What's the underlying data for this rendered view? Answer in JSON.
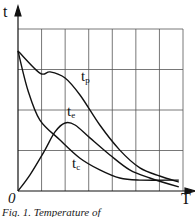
{
  "chart_data": {
    "type": "line",
    "title": "",
    "xlabel": "T",
    "ylabel": "t",
    "origin_label": "0",
    "grid": true,
    "grid_columns": 7,
    "grid_rows": 4,
    "xlim": [
      0,
      7
    ],
    "ylim": [
      0,
      4
    ],
    "series": [
      {
        "name": "t_p",
        "label_main": "t",
        "label_sub": "p",
        "x": [
          0,
          0.93,
          1.36,
          2.0,
          2.63,
          3.47,
          4.32,
          5.17,
          6.01,
          6.82
        ],
        "y": [
          3.46,
          2.91,
          2.94,
          2.79,
          2.37,
          1.63,
          1.01,
          0.57,
          0.37,
          0.22
        ]
      },
      {
        "name": "t_e",
        "label_main": "t",
        "label_sub": "e",
        "x": [
          0,
          0.51,
          1.14,
          1.57,
          2.0,
          2.42,
          3.05,
          3.9,
          4.74,
          5.59,
          6.82
        ],
        "y": [
          0,
          0.4,
          1.01,
          1.46,
          1.68,
          1.63,
          1.31,
          0.89,
          0.52,
          0.32,
          0.1
        ]
      },
      {
        "name": "t_c",
        "label_main": "t",
        "label_sub": "c",
        "x": [
          0,
          0.42,
          0.93,
          1.78,
          2.63,
          3.47,
          4.32,
          5.17,
          6.82
        ],
        "y": [
          3.46,
          2.49,
          1.75,
          1.26,
          0.81,
          0.52,
          0.32,
          0.27,
          0.27
        ]
      }
    ],
    "annotations": [
      "t_p",
      "t_e",
      "t_c"
    ]
  },
  "caption": "Fig. 1. Temperature of"
}
